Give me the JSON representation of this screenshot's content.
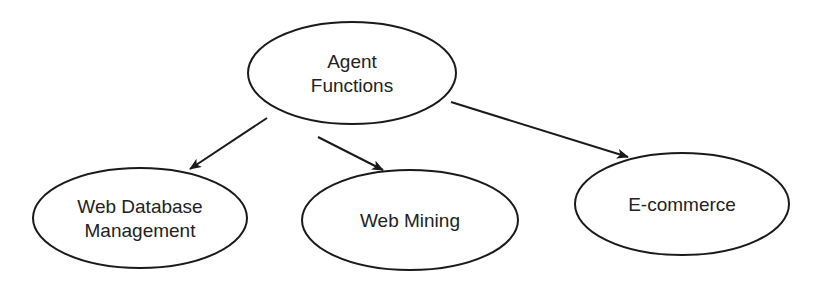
{
  "diagram": {
    "type": "tree",
    "stroke_color": "#1a1a1a",
    "text_color": "#222222",
    "background": "#ffffff",
    "nodes": [
      {
        "id": "agent-functions",
        "lines": [
          "Agent",
          "Functions"
        ],
        "cx": 352,
        "cy": 73,
        "rx": 104,
        "ry": 51
      },
      {
        "id": "web-database-management",
        "lines": [
          "Web Database",
          "Management"
        ],
        "cx": 140,
        "cy": 218,
        "rx": 107,
        "ry": 50
      },
      {
        "id": "web-mining",
        "lines": [
          "Web Mining"
        ],
        "cx": 410,
        "cy": 220,
        "rx": 108,
        "ry": 50
      },
      {
        "id": "e-commerce",
        "lines": [
          "E-commerce"
        ],
        "cx": 682,
        "cy": 204,
        "rx": 107,
        "ry": 51
      }
    ],
    "edges": [
      {
        "from": "agent-functions",
        "to": "web-database-management"
      },
      {
        "from": "agent-functions",
        "to": "web-mining"
      },
      {
        "from": "agent-functions",
        "to": "e-commerce"
      }
    ]
  }
}
